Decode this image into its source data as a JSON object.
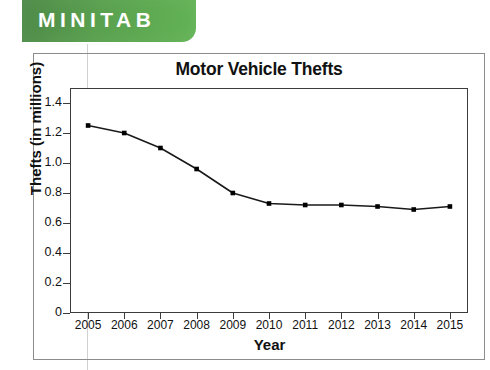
{
  "banner": {
    "wordmark": "MINITAB",
    "color": "#5aa14f"
  },
  "chart_data": {
    "type": "line",
    "title": "Motor Vehicle Thefts",
    "xlabel": "Year",
    "ylabel": "Thefts (in millions)",
    "categories": [
      "2005",
      "2006",
      "2007",
      "2008",
      "2009",
      "2010",
      "2011",
      "2012",
      "2013",
      "2014",
      "2015"
    ],
    "values": [
      1.25,
      1.2,
      1.1,
      0.96,
      0.8,
      0.73,
      0.72,
      0.72,
      0.71,
      0.69,
      0.71
    ],
    "x": [
      2005,
      2006,
      2007,
      2008,
      2009,
      2010,
      2011,
      2012,
      2013,
      2014,
      2015
    ],
    "ylim": [
      0,
      1.5
    ],
    "xlim": [
      2004.5,
      2015.5
    ],
    "y_ticks": [
      "0",
      "0.2",
      "0.4",
      "0.6",
      "0.8",
      "1.0",
      "1.2",
      "1.4"
    ],
    "y_tick_values": [
      0,
      0.2,
      0.4,
      0.6,
      0.8,
      1.0,
      1.2,
      1.4
    ],
    "x_ticks": [
      "2005",
      "2006",
      "2007",
      "2008",
      "2009",
      "2010",
      "2011",
      "2012",
      "2013",
      "2014",
      "2015"
    ],
    "grid": false,
    "legend": null,
    "marker": "filled-square",
    "line_color": "#1a1a1a",
    "marker_color": "#000000"
  }
}
